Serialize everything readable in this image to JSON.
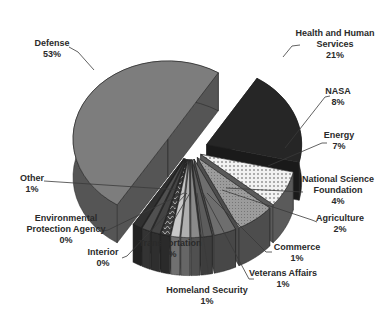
{
  "chart_data": {
    "type": "pie",
    "style": "3d-exploded",
    "title": "",
    "legend": "none",
    "labels_position": "outside-with-leader-lines",
    "slices": [
      {
        "name": "Defense",
        "value": 53,
        "label": "53%",
        "fill": "#7d7d7d",
        "side": "#555555",
        "pattern": "solid",
        "label_lines": [
          "Defense",
          "53%"
        ],
        "label_xy": [
          52,
          38
        ],
        "leader": [
          [
            69,
            47
          ],
          [
            78,
            52
          ],
          [
            94,
            70
          ]
        ]
      },
      {
        "name": "Health and Human Services",
        "value": 21,
        "label": "21%",
        "fill": "#262626",
        "side": "#1a1a1a",
        "pattern": "solid",
        "label_lines": [
          "Health and Human",
          "Services",
          "21%"
        ],
        "label_xy": [
          335,
          28
        ],
        "leader": [
          [
            300,
            45
          ],
          [
            292,
            46
          ],
          [
            283,
            57
          ]
        ]
      },
      {
        "name": "NASA",
        "value": 8,
        "label": "8%",
        "fill": "#e8e8e8",
        "side": "#5a5a5a",
        "pattern": "dots",
        "label_lines": [
          "NASA",
          "8%"
        ],
        "label_xy": [
          338,
          86
        ],
        "leader": [
          [
            330,
            96
          ],
          [
            325,
            97
          ],
          [
            285,
            148
          ]
        ]
      },
      {
        "name": "Energy",
        "value": 7,
        "label": "7%",
        "fill": "#9a9a9a",
        "side": "#4d4d4d",
        "pattern": "fine-dots",
        "label_lines": [
          "Energy",
          "7%"
        ],
        "label_xy": [
          339,
          130
        ],
        "leader": [
          [
            327,
            143
          ],
          [
            322,
            143
          ],
          [
            268,
            166
          ]
        ]
      },
      {
        "name": "National Science Foundation",
        "value": 4,
        "label": "4%",
        "fill": "#6e6e6e",
        "side": "#474747",
        "pattern": "solid",
        "label_lines": [
          "National Science",
          "Foundation",
          "4%"
        ],
        "label_xy": [
          338,
          174
        ],
        "leader": [
          [
            303,
            192
          ],
          [
            226,
            188
          ]
        ]
      },
      {
        "name": "Agriculture",
        "value": 2,
        "label": "2%",
        "fill": "#5c5c5c",
        "side": "#3d3d3d",
        "pattern": "solid",
        "label_lines": [
          "Agriculture",
          "2%"
        ],
        "label_xy": [
          340,
          213
        ],
        "leader": [
          [
            317,
            222
          ],
          [
            312,
            220
          ],
          [
            222,
            190
          ]
        ]
      },
      {
        "name": "Commerce",
        "value": 1,
        "label": "1%",
        "fill": "#8a8a8a",
        "side": "#505050",
        "pattern": "solid",
        "label_lines": [
          "Commerce",
          "1%"
        ],
        "label_xy": [
          297,
          242
        ],
        "leader": [
          [
            272,
            252
          ],
          [
            266,
            252
          ],
          [
            207,
            193
          ]
        ]
      },
      {
        "name": "Veterans Affairs",
        "value": 1,
        "label": "1%",
        "fill": "#b0b0b0",
        "side": "#666666",
        "pattern": "solid",
        "label_lines": [
          "Veterans Affairs",
          "1%"
        ],
        "label_xy": [
          283,
          268
        ],
        "leader": [
          [
            254,
            279
          ],
          [
            249,
            279
          ],
          [
            203,
            193
          ]
        ]
      },
      {
        "name": "Homeland Security",
        "value": 1,
        "label": "1%",
        "fill": "#c8c8c8",
        "side": "#707070",
        "pattern": "solid",
        "label_lines": [
          "Homeland Security",
          "1%"
        ],
        "label_xy": [
          207,
          285
        ],
        "leader": [
          [
            208,
            274
          ],
          [
            208,
            270
          ],
          [
            197,
            193
          ]
        ]
      },
      {
        "name": "Transportation",
        "value": 1,
        "label": "1%",
        "fill": "#3a3a3a",
        "side": "#2a2a2a",
        "pattern": "zigzag",
        "label_lines": [
          "Transportation",
          "1%"
        ],
        "label_xy": [
          170,
          238
        ],
        "leader": [
          [
            170,
            233
          ],
          [
            171,
            225
          ],
          [
            190,
            193
          ]
        ]
      },
      {
        "name": "Interior",
        "value": 0,
        "label": "0%",
        "fill": "#444444",
        "side": "#2e2e2e",
        "pattern": "solid",
        "label_lines": [
          "Interior",
          "0%"
        ],
        "label_xy": [
          103,
          247
        ],
        "leader": [
          [
            122,
            258
          ],
          [
            127,
            256
          ],
          [
            187,
            193
          ]
        ]
      },
      {
        "name": "Environmental Protection Agency",
        "value": 0,
        "label": "0%",
        "fill": "#505050",
        "side": "#333333",
        "pattern": "solid",
        "label_lines": [
          "Environmental",
          "Protection Agency",
          "0%"
        ],
        "label_xy": [
          66,
          213
        ],
        "leader": [
          [
            103,
            231
          ],
          [
            108,
            230
          ],
          [
            184,
            193
          ]
        ]
      },
      {
        "name": "Other",
        "value": 1,
        "label": "1%",
        "fill": "#303030",
        "side": "#222222",
        "pattern": "solid",
        "label_lines": [
          "Other",
          "1%"
        ],
        "label_xy": [
          32,
          173
        ],
        "leader": [
          [
            44,
            181
          ],
          [
            182,
            190
          ]
        ]
      }
    ]
  }
}
